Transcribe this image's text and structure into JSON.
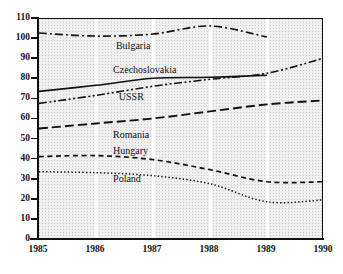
{
  "chart_data": {
    "type": "line",
    "title": "",
    "xlabel": "",
    "ylabel": "",
    "x": [
      1985,
      1986,
      1987,
      1988,
      1989,
      1990
    ],
    "xtick_labels": [
      "1985",
      "1986",
      "1987",
      "1988",
      "1989",
      "1990"
    ],
    "ytick_labels": [
      "110",
      "100",
      "90",
      "80",
      "70",
      "60",
      "50",
      "40",
      "30",
      "20",
      "10",
      "0"
    ],
    "yticks": [
      110,
      100,
      90,
      80,
      70,
      60,
      50,
      40,
      30,
      20,
      10,
      0
    ],
    "ylim": [
      0,
      110
    ],
    "xlim": [
      1985,
      1990
    ],
    "grid": "vertical-white-gridlines",
    "legend": "inline-labels",
    "series": [
      {
        "name": "Bulgaria",
        "style": "dash-dot",
        "values": [
          103.0,
          101.5,
          102.5,
          106.5,
          101.0,
          null
        ],
        "label_x": 1986.35,
        "label_y": 96.5
      },
      {
        "name": "Czechoslovakia",
        "style": "solid",
        "values": [
          74.0,
          77.0,
          80.5,
          81.0,
          82.0,
          null
        ],
        "label_x": 1986.3,
        "label_y": 84.5
      },
      {
        "name": "USSR",
        "style": "dash-dot-dot",
        "values": [
          68.0,
          72.0,
          76.5,
          80.0,
          83.0,
          90.5
        ],
        "label_x": 1986.4,
        "label_y": 71.0
      },
      {
        "name": "Romania",
        "style": "long-dash",
        "values": [
          55.5,
          58.0,
          60.5,
          64.0,
          67.5,
          69.5
        ],
        "label_x": 1986.3,
        "label_y": 52.5
      },
      {
        "name": "Hungary",
        "style": "short-dash",
        "values": [
          41.5,
          42.0,
          40.0,
          35.0,
          29.0,
          29.0
        ],
        "label_x": 1986.3,
        "label_y": 44.5
      },
      {
        "name": "Poland",
        "style": "dotted",
        "values": [
          34.0,
          33.5,
          32.0,
          28.0,
          19.0,
          20.0
        ],
        "label_x": 1986.3,
        "label_y": 30.5
      }
    ]
  },
  "colors": {
    "line": "#111111",
    "plot_background": "#f0f0f0",
    "gridline": "#ffffff",
    "axis": "#111111"
  }
}
